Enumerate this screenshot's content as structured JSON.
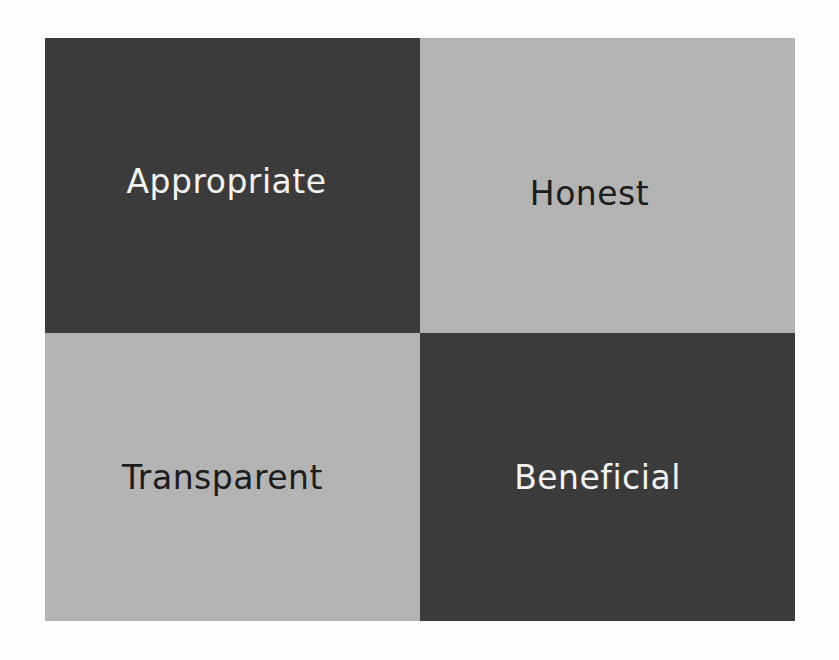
{
  "diagram": {
    "type": "2x2 quadrant grid",
    "cells": [
      {
        "label": "Appropriate",
        "position": "top-left",
        "shade": "dark",
        "bg": "#3b3b3b",
        "fg": "#f2f2f2"
      },
      {
        "label": "Honest",
        "position": "top-right",
        "shade": "light",
        "bg": "#b3b3b3",
        "fg": "#1c1c1c"
      },
      {
        "label": "Transparent",
        "position": "bottom-left",
        "shade": "light",
        "bg": "#b3b3b3",
        "fg": "#1c1c1c"
      },
      {
        "label": "Beneficial",
        "position": "bottom-right",
        "shade": "dark",
        "bg": "#3b3b3b",
        "fg": "#f2f2f2"
      }
    ]
  }
}
